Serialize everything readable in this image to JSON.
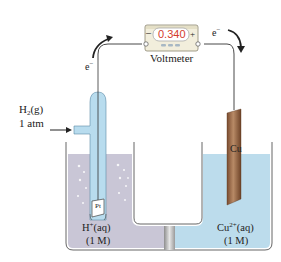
{
  "diagram": {
    "type": "galvanic-cell",
    "voltmeter": {
      "reading": "0.340",
      "label": "Voltmeter",
      "negative_terminal": "–",
      "positive_terminal": "+"
    },
    "electron_flow": {
      "left_label": "e",
      "right_label": "e",
      "charge": "−"
    },
    "gas_input": {
      "formula_main": "H",
      "formula_sub": "2",
      "formula_state": "(g)",
      "pressure": "1 atm"
    },
    "left_electrode": {
      "label": "Pt",
      "solution_ion": "H",
      "solution_charge": "+",
      "solution_state": "(aq)",
      "concentration": "(1 M)"
    },
    "right_electrode": {
      "label": "Cu",
      "solution_ion": "Cu",
      "solution_charge": "2+",
      "solution_state": "(aq)",
      "concentration": "(1 M)"
    },
    "colors": {
      "left_solution": "#c9c6d6",
      "right_solution": "#bcdcec",
      "glass_tube": "#b8dcee",
      "copper": "#9a6a48",
      "readout_red": "#d43a2c",
      "voltmeter_body": "#f2eedc"
    }
  }
}
